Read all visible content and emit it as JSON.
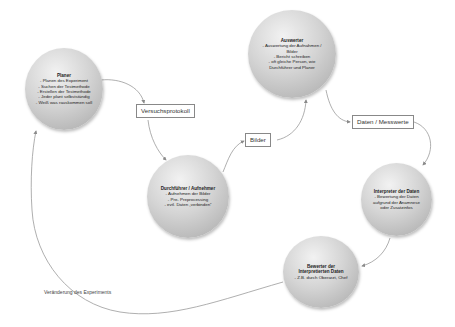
{
  "nodes": {
    "planer": {
      "title": "Planer",
      "lines": [
        "- Planen des Experiment",
        "- Suchen der Testmethode",
        "- Erstellen der Testmethode",
        "- Jeder plant selbstständig",
        "- Weiß was rauskommen soll"
      ]
    },
    "auswerter": {
      "title": "Auswerter",
      "lines": [
        "- Auswertung der Aufnahmen /",
        "Bilder",
        "- Bericht schreiben",
        "- oft gleiche Person, wie",
        "Durchführer und Planer"
      ]
    },
    "durchfuehrer": {
      "title": "Durchführer / Aufnehmer",
      "lines": [
        "- Aufnehmen der Bilder",
        "- Pre- Preprocessing",
        "- evtl. Daten „verbinden“"
      ]
    },
    "interpreter": {
      "title": "Interpreter der Daten",
      "lines": [
        "- Bewertung der Daten",
        "aufgrund  der Anamnese",
        "oder Zusatzinfos"
      ]
    },
    "bewerter": {
      "title": "Bewerter der",
      "title2": "Interpretierten Daten",
      "lines": [
        "- Z.B. durch Oberarzt, Chef"
      ]
    }
  },
  "edge_labels": {
    "versuchsprotokoll": "Versuchsprotokoll",
    "bilder": "Bilder",
    "daten_messwerte": "Daten / Messwerte",
    "veraenderung": "Veränderung des Experiments"
  },
  "colors": {
    "arrow": "#9a9a9a",
    "node_light": "#f2f2f2",
    "node_dark": "#a8a8a8"
  }
}
